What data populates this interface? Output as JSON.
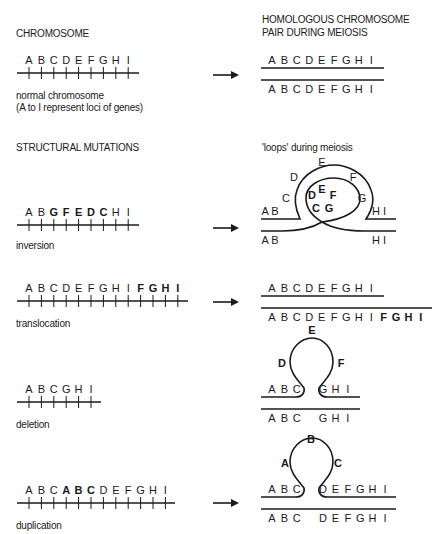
{
  "headings": {
    "chromosome": "CHROMOSOME",
    "homologous_line1": "HOMOLOGOUS CHROMOSOME",
    "homologous_line2": "PAIR DURING MEIOSIS",
    "structural": "STRUCTURAL MUTATIONS",
    "loops": "'loops' during meiosis"
  },
  "normal": {
    "caption1": "normal chromosome",
    "caption2": "(A to I represent loci of genes)",
    "genes": [
      "A",
      "B",
      "C",
      "D",
      "E",
      "F",
      "G",
      "H",
      "I"
    ],
    "pair_top": [
      "A",
      "B",
      "C",
      "D",
      "E",
      "F",
      "G",
      "H",
      "I"
    ],
    "pair_bottom": [
      "A",
      "B",
      "C",
      "D",
      "E",
      "F",
      "G",
      "H",
      "I"
    ]
  },
  "inversion": {
    "caption": "inversion",
    "genes": [
      {
        "l": "A",
        "b": false
      },
      {
        "l": "B",
        "b": false
      },
      {
        "l": "G",
        "b": true
      },
      {
        "l": "F",
        "b": true
      },
      {
        "l": "E",
        "b": true
      },
      {
        "l": "D",
        "b": true
      },
      {
        "l": "C",
        "b": true
      },
      {
        "l": "H",
        "b": false
      },
      {
        "l": "I",
        "b": false
      }
    ],
    "loop_outer": [
      "C",
      "D",
      "E",
      "F",
      "G"
    ],
    "loop_inner": [
      "D",
      "E",
      "F",
      "C",
      "G"
    ],
    "top_left": "A  B",
    "top_right": "H   I",
    "bottom_left": "A  B",
    "bottom_right": "H   I"
  },
  "translocation": {
    "caption": "translocation",
    "genes": [
      {
        "l": "A",
        "b": false
      },
      {
        "l": "B",
        "b": false
      },
      {
        "l": "C",
        "b": false
      },
      {
        "l": "D",
        "b": false
      },
      {
        "l": "E",
        "b": false
      },
      {
        "l": "F",
        "b": false
      },
      {
        "l": "G",
        "b": false
      },
      {
        "l": "H",
        "b": false
      },
      {
        "l": "I",
        "b": false
      },
      {
        "l": "F",
        "b": true
      },
      {
        "l": "G",
        "b": true
      },
      {
        "l": "H",
        "b": true
      },
      {
        "l": "I",
        "b": true
      }
    ],
    "pair_top": [
      "A",
      "B",
      "C",
      "D",
      "E",
      "F",
      "G",
      "H",
      "I"
    ],
    "pair_bottom": [
      {
        "l": "A",
        "b": false
      },
      {
        "l": "B",
        "b": false
      },
      {
        "l": "C",
        "b": false
      },
      {
        "l": "D",
        "b": false
      },
      {
        "l": "E",
        "b": false
      },
      {
        "l": "F",
        "b": false
      },
      {
        "l": "G",
        "b": false
      },
      {
        "l": "H",
        "b": false
      },
      {
        "l": "I",
        "b": false
      },
      {
        "l": "F",
        "b": true
      },
      {
        "l": "G",
        "b": true
      },
      {
        "l": "H",
        "b": true
      },
      {
        "l": "I",
        "b": true
      }
    ]
  },
  "deletion": {
    "caption": "deletion",
    "genes": [
      "A",
      "B",
      "C",
      "G",
      "H",
      "I"
    ],
    "loop": [
      "D",
      "E",
      "F"
    ],
    "top_left": [
      "A",
      "B",
      "C"
    ],
    "top_right": [
      "G",
      "H",
      "I"
    ],
    "bottom_left": [
      "A",
      "B",
      "C"
    ],
    "bottom_right": [
      "G",
      "H",
      "I"
    ]
  },
  "duplication": {
    "caption": "duplication",
    "genes": [
      {
        "l": "A",
        "b": false
      },
      {
        "l": "B",
        "b": false
      },
      {
        "l": "C",
        "b": false
      },
      {
        "l": "A",
        "b": true
      },
      {
        "l": "B",
        "b": true
      },
      {
        "l": "C",
        "b": true
      },
      {
        "l": "D",
        "b": false
      },
      {
        "l": "E",
        "b": false
      },
      {
        "l": "F",
        "b": false
      },
      {
        "l": "G",
        "b": false
      },
      {
        "l": "H",
        "b": false
      },
      {
        "l": "I",
        "b": false
      }
    ],
    "loop": [
      "A",
      "B",
      "C"
    ],
    "top_left": [
      "A",
      "B",
      "C"
    ],
    "top_right": [
      "D",
      "E",
      "F",
      "G",
      "H",
      "I"
    ],
    "bottom_left": [
      "A",
      "B",
      "C"
    ],
    "bottom_right": [
      "D",
      "E",
      "F",
      "G",
      "H",
      "I"
    ]
  },
  "colors": {
    "ink": "#1a1a1a",
    "background": "#ffffff"
  }
}
